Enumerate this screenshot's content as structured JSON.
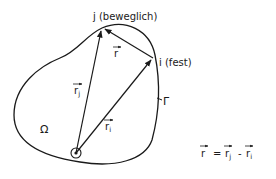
{
  "diagram": {
    "region_label": "Ω",
    "boundary_label": "Γ",
    "point_j_label": "j (beweglich)",
    "point_i_label": "i (fest)",
    "vector_r_label": "r",
    "vector_rj_label": "r",
    "vector_rj_sub": "j",
    "vector_ri_label": "r",
    "vector_ri_sub": "i",
    "equation": {
      "lhs": "r",
      "equals": "=",
      "term1": "r",
      "term1_sub": "j",
      "minus": "-",
      "term2": "r",
      "term2_sub": "i"
    },
    "colors": {
      "ink": "#1a1a1a",
      "background": "#ffffff"
    }
  }
}
